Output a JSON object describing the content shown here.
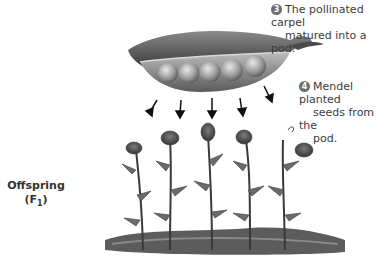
{
  "diagram": {
    "steps": [
      {
        "number": "3",
        "text_line1": "The pollinated carpel",
        "text_line2": "matured into a pod."
      },
      {
        "number": "4",
        "text_line1": "Mendel planted",
        "text_line2": "seeds from the",
        "text_line3": "pod."
      }
    ],
    "offspring_label": {
      "line1": "Offspring",
      "line2_prefix": "(F",
      "line2_sub": "1",
      "line2_suffix": ")"
    },
    "pod": {
      "pea_count": 5,
      "colors": {
        "pod_dark": "#4a4a4a",
        "pod_mid": "#7a7a7a",
        "pea": "#9a9a9a"
      }
    },
    "arrows_count": 5,
    "plants_count": 5
  }
}
